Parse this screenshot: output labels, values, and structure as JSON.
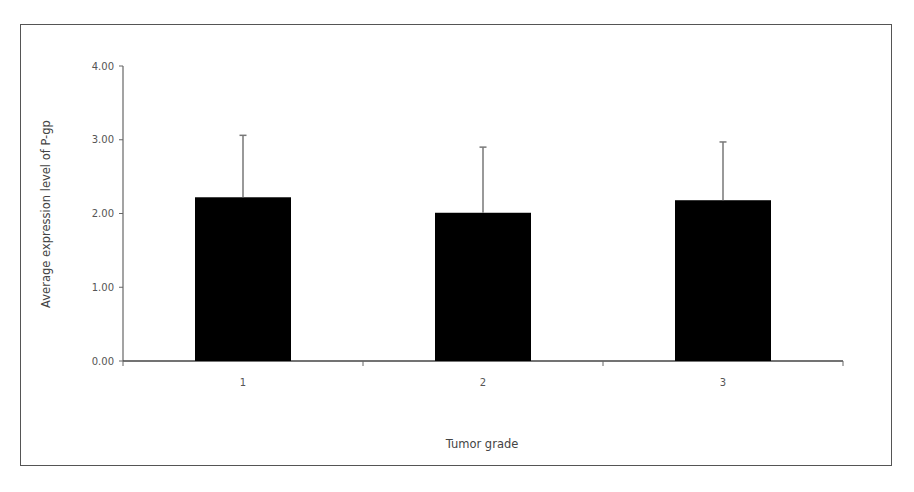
{
  "chart_data": {
    "type": "bar",
    "title": "",
    "xlabel": "Tumor grade",
    "ylabel": "Average expression level of P-gp",
    "categories": [
      "1",
      "2",
      "3"
    ],
    "values": [
      2.22,
      2.01,
      2.18
    ],
    "error_bars": [
      0.84,
      0.89,
      0.79
    ],
    "ylim": [
      0,
      4
    ],
    "yticks": [
      "0.00",
      "1.00",
      "2.00",
      "3.00",
      "4.00"
    ],
    "grid": false,
    "legend": null,
    "bar_color": "#000000"
  }
}
